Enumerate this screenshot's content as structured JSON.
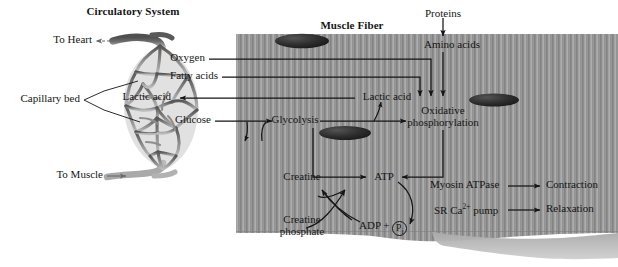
{
  "figure": {
    "type": "biology-diagram"
  },
  "titles": {
    "left": "Circulatory System",
    "right": "Muscle Fiber"
  },
  "circulatory": {
    "to_heart": "To Heart",
    "capillary_bed": "Capillary bed",
    "to_muscle": "To Muscle"
  },
  "substrates": {
    "oxygen": "Oxygen",
    "fatty_acids": "Fatty acids",
    "lactic_acid_out": "Lactic acid",
    "glucose": "Glucose"
  },
  "fiber": {
    "proteins": "Proteins",
    "amino_acids": "Amino acids",
    "lactic_acid_in": "Lactic acid",
    "glycolysis": "Glycolysis",
    "oxidative_line1": "Oxidative",
    "oxidative_line2": "phosphorylation",
    "creatine": "Creatine",
    "creatine_phosphate_line1": "Creatine",
    "creatine_phosphate_line2": "phosphate",
    "atp": "ATP",
    "adp": "ADP +",
    "pi": "P",
    "pi_sub": "i",
    "myosin_atpase": "Myosin ATPase",
    "sr_pump_pre": "SR Ca",
    "sr_pump_sup": "2+",
    "sr_pump_post": " pump",
    "contraction": "Contraction",
    "relaxation": "Relaxation"
  },
  "colors": {
    "fiber_fill": "#9a9a9a",
    "fiber_stripe_dark": "#868686",
    "fiber_stripe_light": "#adadad",
    "nucleus": "#2f2f2f",
    "vessel_top": "#5d5d5d",
    "vessel_bottom": "#a8a8a8",
    "ink": "#151515",
    "sarcolemma": "#bdbdbd",
    "page_bg": "#ffffff"
  }
}
